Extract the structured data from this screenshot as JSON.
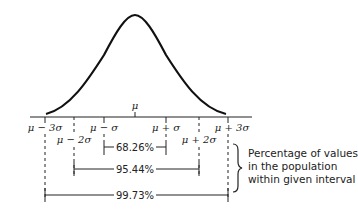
{
  "diagram": {
    "mean_label": "μ",
    "tick_labels": [
      {
        "id": "m3",
        "text": "μ − 3σ"
      },
      {
        "id": "m2",
        "text": "μ − 2σ"
      },
      {
        "id": "m1",
        "text": "μ − σ"
      },
      {
        "id": "p1",
        "text": "μ + σ"
      },
      {
        "id": "p2",
        "text": "μ + 2σ"
      },
      {
        "id": "p3",
        "text": "μ + 3σ"
      }
    ],
    "intervals": [
      {
        "range": "μ ± σ",
        "label": "68.26%"
      },
      {
        "range": "μ ± 2σ",
        "label": "95.44%"
      },
      {
        "range": "μ ± 3σ",
        "label": "99.73%"
      }
    ],
    "annotation": {
      "line1": "Percentage of values",
      "line2": "in the population",
      "line3": "within given interval"
    }
  }
}
